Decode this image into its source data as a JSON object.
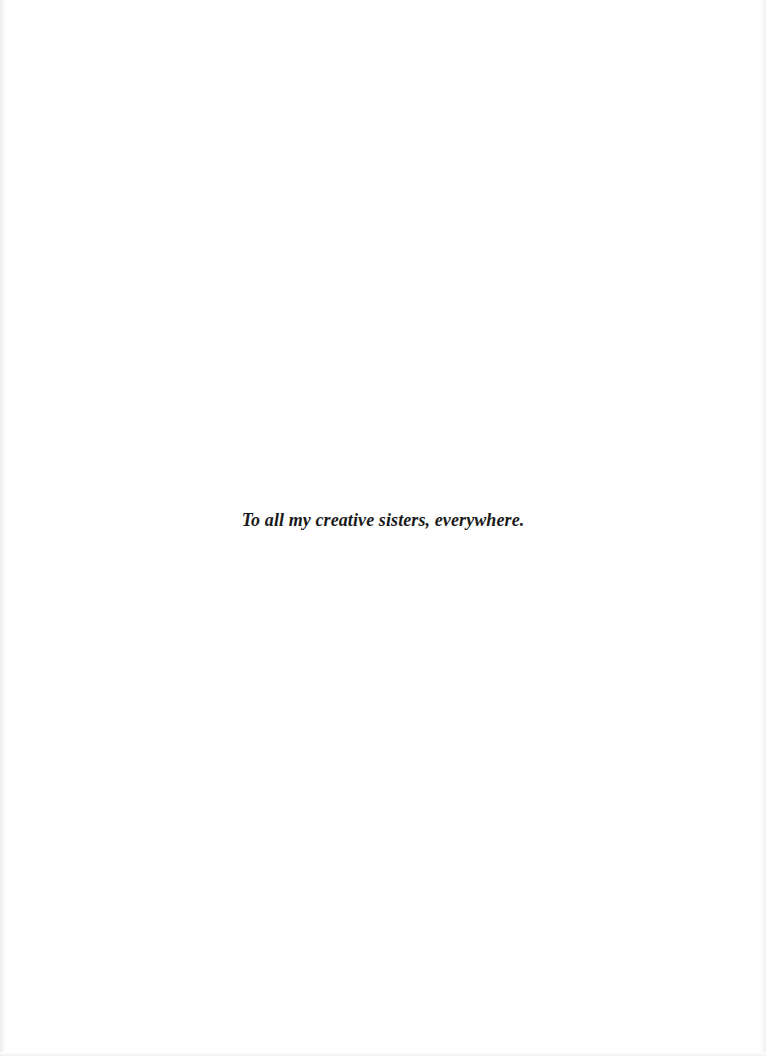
{
  "page": {
    "type": "dedication",
    "dedication_text": "To all my creative sisters, everywhere."
  }
}
